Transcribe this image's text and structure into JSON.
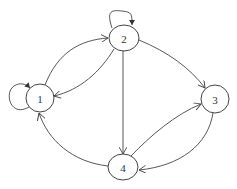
{
  "diagram": {
    "type": "directed-graph",
    "nodes": [
      {
        "id": "1",
        "label": "1",
        "cx": 40,
        "cy": 98,
        "rx": 14,
        "ry": 14
      },
      {
        "id": "2",
        "label": "2",
        "cx": 124,
        "cy": 38,
        "rx": 15,
        "ry": 13
      },
      {
        "id": "3",
        "label": "3",
        "cx": 215,
        "cy": 99,
        "rx": 14,
        "ry": 14
      },
      {
        "id": "4",
        "label": "4",
        "cx": 123,
        "cy": 167,
        "rx": 15,
        "ry": 13
      }
    ],
    "edges": [
      {
        "from": "1",
        "to": "1",
        "kind": "self-loop"
      },
      {
        "from": "1",
        "to": "2"
      },
      {
        "from": "2",
        "to": "1"
      },
      {
        "from": "2",
        "to": "2",
        "kind": "self-loop"
      },
      {
        "from": "2",
        "to": "3"
      },
      {
        "from": "2",
        "to": "4"
      },
      {
        "from": "4",
        "to": "3"
      },
      {
        "from": "3",
        "to": "4"
      },
      {
        "from": "4",
        "to": "1"
      }
    ]
  }
}
